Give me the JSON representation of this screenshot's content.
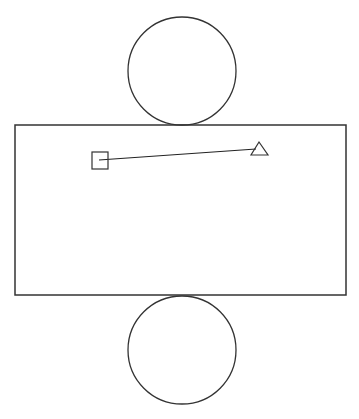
{
  "diagram": {
    "type": "cylinder-net",
    "stroke_color": "#333333",
    "background_color": "#ffffff",
    "top_circle": {
      "cx": 182,
      "cy": 71,
      "r": 54
    },
    "rectangle": {
      "x": 15,
      "y": 125,
      "width": 331,
      "height": 170
    },
    "bottom_circle": {
      "cx": 182,
      "cy": 350,
      "r": 54
    },
    "square_marker": {
      "x": 92,
      "y": 152,
      "width": 16,
      "height": 17
    },
    "triangle_marker": {
      "points": "259,142 251,155 268,155"
    },
    "connector_line": {
      "x1": 99,
      "y1": 160,
      "x2": 256,
      "y2": 149
    }
  }
}
